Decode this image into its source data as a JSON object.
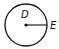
{
  "diagram": {
    "type": "circle-radius",
    "circle": {
      "cx": 26,
      "cy": 25,
      "r": 21,
      "stroke": "#111111"
    },
    "center_point": {
      "label": "D",
      "x": 26,
      "y": 25
    },
    "circumference_point": {
      "label": "E",
      "x": 47,
      "y": 25
    },
    "segments": [
      {
        "from": "D",
        "to": "E",
        "kind": "radius"
      }
    ]
  }
}
